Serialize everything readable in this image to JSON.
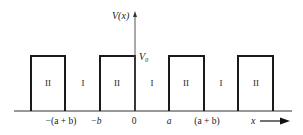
{
  "diagram": {
    "y_axis_label": "V(x)",
    "x_axis_label": "x",
    "barrier_height_label": "V₀",
    "region_labels": [
      "II",
      "I",
      "II",
      "I",
      "II",
      "I",
      "II"
    ],
    "x_ticks": [
      "−(a + b)",
      "−b",
      "0",
      "a",
      "(a + b)"
    ],
    "colors": {
      "line": "#1a1a1a",
      "axis": "#555555",
      "text": "#222222"
    }
  }
}
